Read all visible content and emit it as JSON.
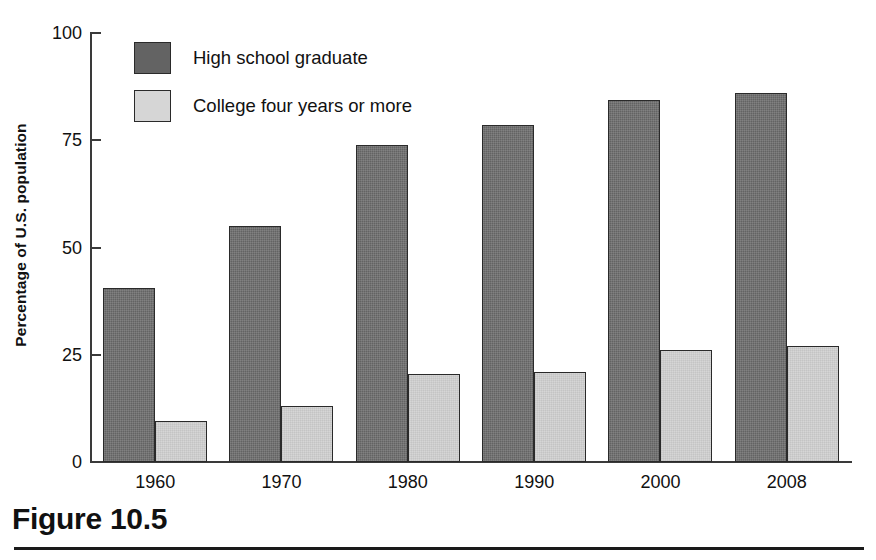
{
  "figure": {
    "caption": "Figure 10.5"
  },
  "chart_data": {
    "type": "bar",
    "title": "",
    "xlabel": "",
    "ylabel": "Percentage of U.S. population",
    "categories": [
      "1960",
      "1970",
      "1980",
      "1990",
      "2000",
      "2008"
    ],
    "ylim": [
      0,
      100
    ],
    "yticks": [
      "0",
      "25",
      "50",
      "75",
      "100"
    ],
    "ytick_values": [
      0,
      25,
      50,
      75,
      100
    ],
    "grid": false,
    "legend_position": "top-left",
    "series": [
      {
        "name": "High school graduate",
        "color": "#636363",
        "values": [
          40.5,
          55,
          74,
          78.5,
          84.5,
          86
        ]
      },
      {
        "name": "College four years or more",
        "color": "#d6d6d6",
        "values": [
          9.5,
          13,
          20.5,
          21,
          26,
          27
        ]
      }
    ]
  },
  "legend": {
    "items": [
      {
        "label": "High school graduate",
        "swatch": "#636363"
      },
      {
        "label": "College four years or more",
        "swatch": "#d6d6d6"
      }
    ]
  },
  "colors": {
    "axis": "#3a3a3a",
    "text": "#111111",
    "background": "#ffffff",
    "series_dark": "#636363",
    "series_light": "#d6d6d6"
  }
}
